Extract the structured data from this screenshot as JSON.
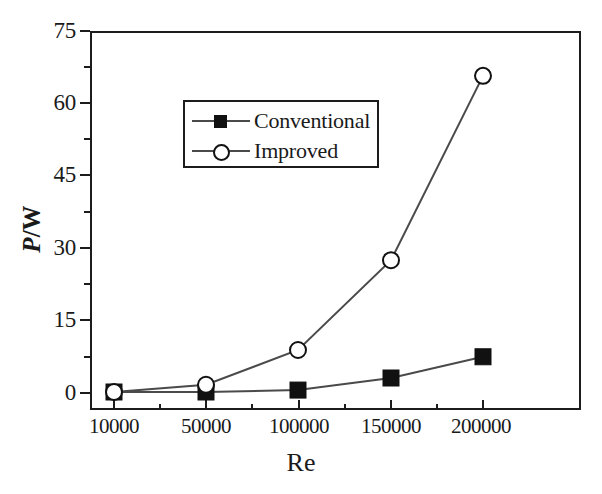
{
  "chart_data": {
    "type": "line",
    "title": "",
    "subtitle": "",
    "xlabel": "Re",
    "ylabel": "P/W",
    "ylabel_parts": {
      "symbol": "P",
      "separator": "/",
      "unit": "W"
    },
    "categories": [
      "10000",
      "50000",
      "100000",
      "150000",
      "200000"
    ],
    "x_tick_labels": [
      "10000",
      "50000",
      "100000",
      "150000",
      "200000"
    ],
    "y_tick_labels": [
      "0",
      "15",
      "30",
      "45",
      "60",
      "75"
    ],
    "y_ticks": [
      0,
      15,
      30,
      45,
      60,
      75
    ],
    "ylim": [
      -3.5,
      75
    ],
    "xlim_categorical": true,
    "x_minor_ticks_between": 1,
    "y_minor_ticks_between": 1,
    "grid": false,
    "legend_position": "upper-left-inside",
    "series": [
      {
        "name": "Conventional",
        "marker": "filled-square",
        "marker_color": "#111111",
        "line_color": "#4a4a4a",
        "values": [
          0.0,
          0.0,
          0.4,
          2.9,
          7.3
        ]
      },
      {
        "name": "Improved",
        "marker": "open-circle",
        "marker_color": "#111111",
        "line_color": "#4a4a4a",
        "values": [
          0.0,
          1.5,
          8.7,
          27.3,
          65.5
        ]
      }
    ],
    "colors": {
      "axis": "#1c1c1c",
      "line": "#4a4a4a",
      "marker_fill": "#111111",
      "marker_open_fill": "#ffffff",
      "background": "#ffffff"
    }
  },
  "legend": {
    "items": [
      {
        "label": "Conventional",
        "marker": "filled-square-icon"
      },
      {
        "label": "Improved",
        "marker": "open-circle-icon"
      }
    ]
  },
  "axes": {
    "x_title": "Re",
    "y_title_symbol": "P",
    "y_title_sep": "/",
    "y_title_unit": "W"
  }
}
